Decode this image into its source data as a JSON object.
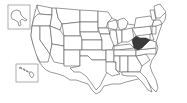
{
  "map": {
    "title": "United States map",
    "highlighted_state": "West Virginia",
    "colors": {
      "background": "#ffffff",
      "state_fill": "#ffffff",
      "state_border": "#555555",
      "highlight_fill": "#3a3a3a",
      "inset_border": "#777777"
    },
    "insets": [
      {
        "name": "Alaska"
      },
      {
        "name": "Hawaii"
      }
    ]
  }
}
